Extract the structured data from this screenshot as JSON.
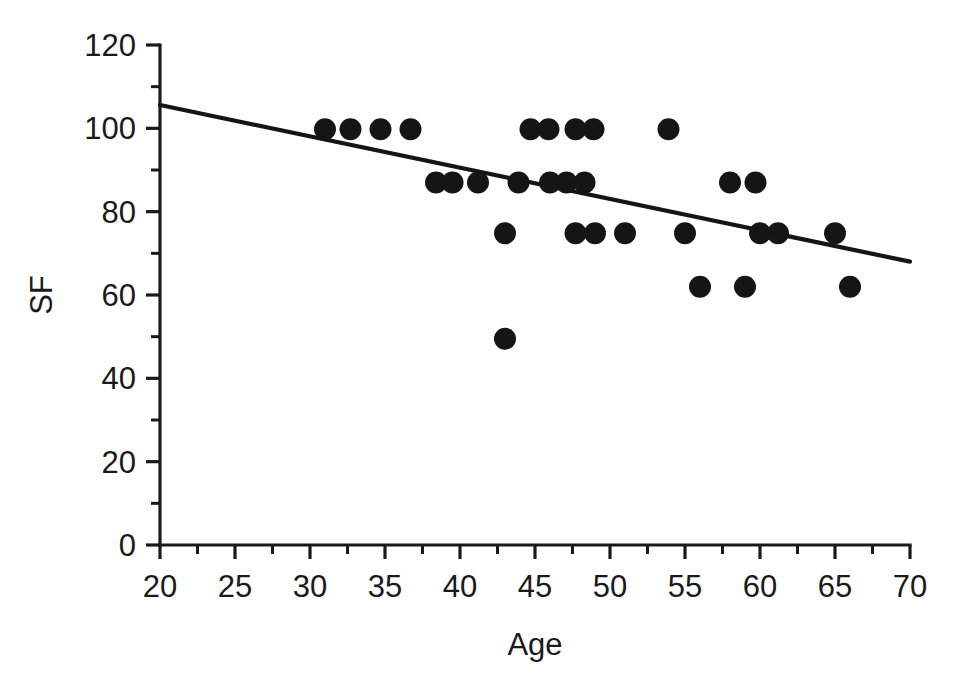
{
  "chart_data": {
    "type": "scatter",
    "title": "",
    "subtitle": "",
    "xlabel": "Age",
    "ylabel": "SF",
    "xlim": [
      20,
      70
    ],
    "ylim": [
      0,
      120
    ],
    "grid": false,
    "legend": null,
    "x_ticks": [
      20,
      25,
      30,
      35,
      40,
      45,
      50,
      55,
      60,
      65,
      70
    ],
    "x_tick_labels": [
      "20",
      "25",
      "30",
      "35",
      "40",
      "45",
      "50",
      "55",
      "60",
      "65",
      "70"
    ],
    "x_minor_tick_interval": 2.5,
    "y_ticks": [
      0,
      20,
      40,
      60,
      80,
      100,
      120
    ],
    "y_tick_labels": [
      "0",
      "20",
      "40",
      "60",
      "80",
      "100",
      "120"
    ],
    "y_minor_tick_interval": 10,
    "marker": "filled-circle",
    "marker_color": "#151515",
    "marker_size_px": 22,
    "points": [
      {
        "x": 31.0,
        "y": 99.8
      },
      {
        "x": 32.7,
        "y": 99.8
      },
      {
        "x": 34.7,
        "y": 99.8
      },
      {
        "x": 36.7,
        "y": 99.8
      },
      {
        "x": 44.7,
        "y": 99.8
      },
      {
        "x": 45.9,
        "y": 99.8
      },
      {
        "x": 47.7,
        "y": 99.8
      },
      {
        "x": 48.9,
        "y": 99.8
      },
      {
        "x": 53.9,
        "y": 99.8
      },
      {
        "x": 38.4,
        "y": 87.0
      },
      {
        "x": 39.5,
        "y": 87.0
      },
      {
        "x": 41.2,
        "y": 87.0
      },
      {
        "x": 43.9,
        "y": 87.0
      },
      {
        "x": 46.0,
        "y": 87.0
      },
      {
        "x": 47.1,
        "y": 87.0
      },
      {
        "x": 48.3,
        "y": 87.0
      },
      {
        "x": 58.0,
        "y": 87.0
      },
      {
        "x": 59.7,
        "y": 87.0
      },
      {
        "x": 43.0,
        "y": 74.8
      },
      {
        "x": 47.7,
        "y": 74.8
      },
      {
        "x": 49.0,
        "y": 74.8
      },
      {
        "x": 51.0,
        "y": 74.8
      },
      {
        "x": 55.0,
        "y": 74.8
      },
      {
        "x": 60.0,
        "y": 74.8
      },
      {
        "x": 61.2,
        "y": 74.8
      },
      {
        "x": 65.0,
        "y": 74.8
      },
      {
        "x": 56.0,
        "y": 62.0
      },
      {
        "x": 59.0,
        "y": 62.0
      },
      {
        "x": 66.0,
        "y": 62.0
      },
      {
        "x": 43.0,
        "y": 49.5
      }
    ],
    "trendline": {
      "type": "linear-fit",
      "color": "#151515",
      "x_start": 20,
      "y_start": 105.6,
      "x_end": 70,
      "y_end": 68.0,
      "slope": -0.752,
      "intercept": 120.6
    }
  },
  "axes": {
    "x_title": "Age",
    "y_title": "SF"
  }
}
